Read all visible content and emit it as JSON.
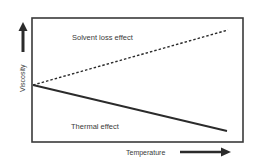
{
  "diagram": {
    "type": "conceptual line diagram",
    "x_axis": {
      "label": "Temperature",
      "direction": "increasing (arrow right)"
    },
    "y_axis": {
      "label": "Viscosity",
      "direction": "increasing (arrow up)"
    },
    "lines": [
      {
        "name": "Solvent loss effect",
        "style": "dashed",
        "trend": "increasing",
        "label": "Solvent loss effect"
      },
      {
        "name": "Thermal effect",
        "style": "solid",
        "trend": "decreasing",
        "label": "Thermal effect"
      }
    ],
    "colors": {
      "line": "#2b2b2b",
      "frame": "#3a3a3a",
      "text": "#3a3a3a",
      "background": "#ffffff"
    }
  }
}
